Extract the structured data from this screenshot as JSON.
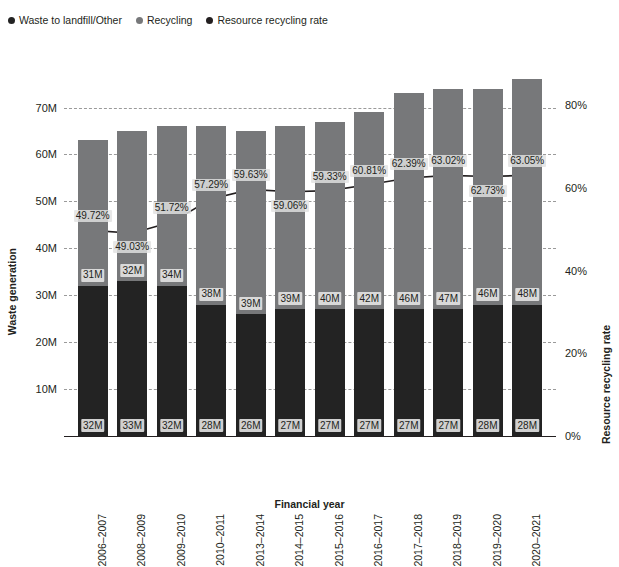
{
  "chart_data": {
    "type": "bar",
    "subtype": "stacked-bar-with-line",
    "title": "",
    "xlabel": "Financial year",
    "ylabel": "Waste generation",
    "y2label": "Resource recycling rate",
    "categories": [
      "2006–2007",
      "2008–2009",
      "2009–2010",
      "2010–2011",
      "2013–2014",
      "2014–2015",
      "2015–2016",
      "2016–2017",
      "2017–2018",
      "2018–2019",
      "2019–2020",
      "2020–2021"
    ],
    "series": [
      {
        "name": "Waste to landfill/Other",
        "type": "bar",
        "color": "#232323",
        "axis": "left",
        "values": [
          32,
          33,
          32,
          28,
          26,
          27,
          27,
          27,
          27,
          27,
          28,
          28
        ],
        "labels": [
          "32M",
          "33M",
          "32M",
          "28M",
          "26M",
          "27M",
          "27M",
          "27M",
          "27M",
          "27M",
          "28M",
          "28M"
        ]
      },
      {
        "name": "Recycling",
        "type": "bar",
        "color": "#77787a",
        "axis": "left",
        "values": [
          31,
          32,
          34,
          38,
          39,
          39,
          40,
          42,
          46,
          47,
          46,
          48
        ],
        "labels": [
          "31M",
          "32M",
          "34M",
          "38M",
          "39M",
          "39M",
          "40M",
          "42M",
          "46M",
          "47M",
          "46M",
          "48M"
        ]
      },
      {
        "name": "Resource recycling rate",
        "type": "line",
        "color": "#231f20",
        "axis": "right",
        "values": [
          49.72,
          49.03,
          51.72,
          57.29,
          59.63,
          59.06,
          59.33,
          60.81,
          62.39,
          63.02,
          62.73,
          63.05
        ],
        "labels": [
          "49.72%",
          "49.03%",
          "51.72%",
          "57.29%",
          "59.63%",
          "59.06%",
          "59.33%",
          "60.81%",
          "62.39%",
          "63.02%",
          "62.73%",
          "63.05%"
        ]
      }
    ],
    "totals": [
      63,
      65,
      66,
      66,
      65,
      66,
      67,
      69,
      73,
      74,
      74,
      76
    ],
    "yaxis_left": {
      "ticks": [
        "10M",
        "20M",
        "30M",
        "40M",
        "50M",
        "60M",
        "70M"
      ],
      "tick_values": [
        10,
        20,
        30,
        40,
        50,
        60,
        70
      ],
      "min": 0,
      "max": 78
    },
    "yaxis_right": {
      "ticks": [
        "0%",
        "20%",
        "40%",
        "60%",
        "80%"
      ],
      "tick_values": [
        0,
        20,
        40,
        60,
        80
      ],
      "min": 0,
      "max": 88.5
    },
    "grid": true,
    "legend_position": "top-left"
  },
  "legend": {
    "items": [
      {
        "label": "Waste to landfill/Other",
        "color": "#232323"
      },
      {
        "label": "Recycling",
        "color": "#77787a"
      },
      {
        "label": "Resource recycling rate",
        "color": "#231f20"
      }
    ]
  },
  "colors": {
    "waste": "#232323",
    "recycling": "#77787a",
    "line": "#231f20",
    "grid": "#9a9a9a",
    "axis": "#231f20",
    "label_bg_recycling": "#d9d9d9",
    "label_bg_waste": "#d0d0d0",
    "background": "#ffffff"
  }
}
